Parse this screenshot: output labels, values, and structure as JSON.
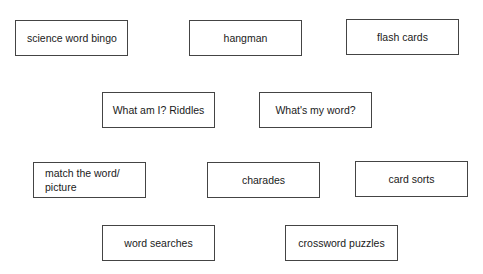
{
  "diagram": {
    "boxes": [
      {
        "label": "science word bingo"
      },
      {
        "label": "hangman"
      },
      {
        "label": "flash cards"
      },
      {
        "label": "What am I? Riddles"
      },
      {
        "label": "What's my word?"
      },
      {
        "label": "match the word/\npicture"
      },
      {
        "label": "charades"
      },
      {
        "label": "card sorts"
      },
      {
        "label": "word searches"
      },
      {
        "label": "crossword puzzles"
      }
    ],
    "colors": {
      "border": "#444444",
      "text": "#1a1a1a",
      "background": "#ffffff"
    }
  }
}
